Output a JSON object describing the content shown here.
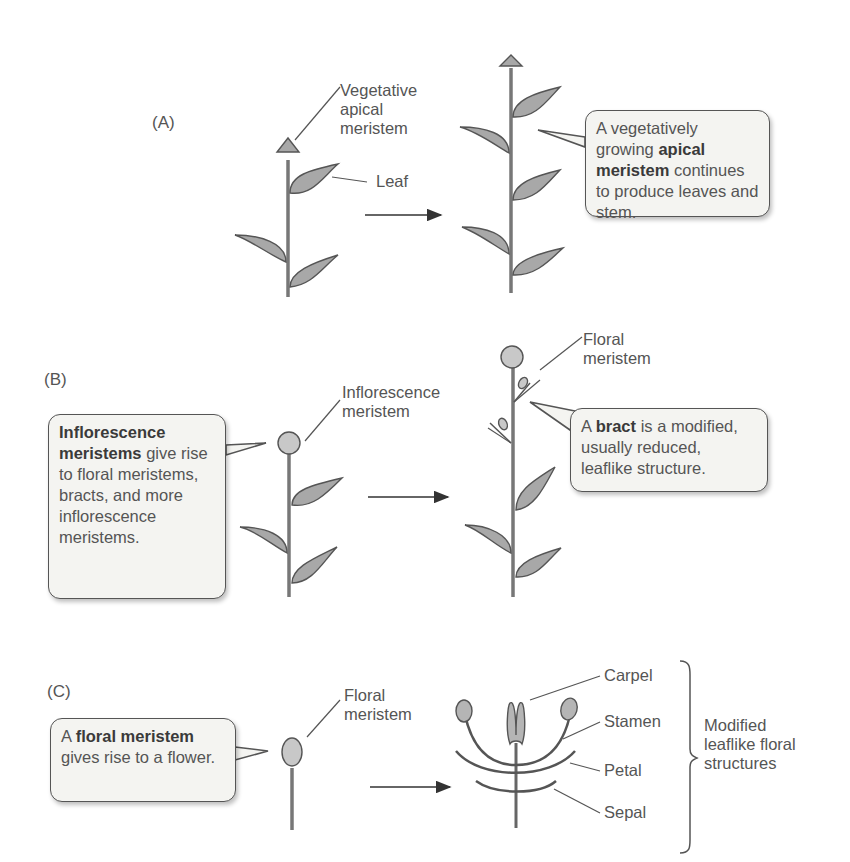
{
  "panels": {
    "A": {
      "label": "(A)",
      "apical_label": [
        "Vegetative",
        "apical",
        "meristem"
      ],
      "leaf_label": "Leaf",
      "callout": {
        "pre": "A vegetatively growing ",
        "bold": "apical meristem",
        "post": " continues to produce leaves and stem."
      }
    },
    "B": {
      "label": "(B)",
      "inflorescence_label": [
        "Inflorescence",
        "meristem"
      ],
      "floral_label": [
        "Floral",
        "meristem"
      ],
      "callout_left": {
        "bold": "Inflorescence meristems",
        "post": " give rise to floral meristems, bracts, and more inflorescence meristems."
      },
      "callout_right": {
        "pre": "A ",
        "bold": "bract",
        "post": " is a modified, usually reduced, leaflike structure."
      }
    },
    "C": {
      "label": "(C)",
      "floral_label": [
        "Floral",
        "meristem"
      ],
      "callout": {
        "pre": "A ",
        "bold": "floral meristem",
        "post": " gives rise to a flower."
      },
      "parts": [
        "Carpel",
        "Stamen",
        "Petal",
        "Sepal"
      ],
      "bracket_label": [
        "Modified",
        "leaflike floral",
        "structures"
      ]
    }
  },
  "colors": {
    "leaf_fill": "#a8a8a8",
    "stroke": "#555555",
    "callout_bg": "#f4f4f1",
    "meristem_fill": "#c8c8c8"
  }
}
